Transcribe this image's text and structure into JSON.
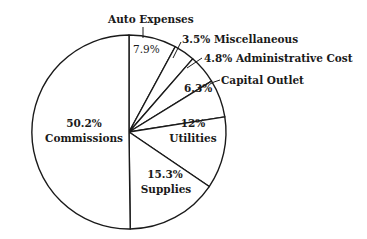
{
  "chart_data": {
    "type": "pie",
    "title": "",
    "start_angle_deg": 0,
    "direction": "clockwise",
    "slices": [
      {
        "label": "Auto Expenses",
        "value": 7.9,
        "value_label": "7.9%"
      },
      {
        "label": "Miscellaneous",
        "value": 3.5,
        "value_label": "3.5%"
      },
      {
        "label": "Administrative Cost",
        "value": 4.8,
        "value_label": "4.8%"
      },
      {
        "label": "Capital Outlet",
        "value": 6.3,
        "value_label": "6.3%"
      },
      {
        "label": "Utilities",
        "value": 12,
        "value_label": "12%"
      },
      {
        "label": "Supplies",
        "value": 15.3,
        "value_label": "15.3%"
      },
      {
        "label": "Commissions",
        "value": 50.2,
        "value_label": "50.2%"
      }
    ],
    "categories": [
      "Auto Expenses",
      "Miscellaneous",
      "Administrative Cost",
      "Capital Outlet",
      "Utilities",
      "Supplies",
      "Commissions"
    ],
    "values": [
      7.9,
      3.5,
      4.8,
      6.3,
      12,
      15.3,
      50.2
    ],
    "legend": "none (labels placed on/near slices)"
  },
  "labels": {
    "auto_name": "Auto Expenses",
    "auto_pct": "7.9%",
    "misc": "3.5% Miscellaneous",
    "admin": "4.8% Administrative Cost",
    "capital_name": "Capital Outlet",
    "capital_pct": "6.3%",
    "utilities_pct": "12%",
    "utilities_name": "Utilities",
    "supplies_pct": "15.3%",
    "supplies_name": "Supplies",
    "commissions_pct": "50.2%",
    "commissions_name": "Commissions"
  }
}
